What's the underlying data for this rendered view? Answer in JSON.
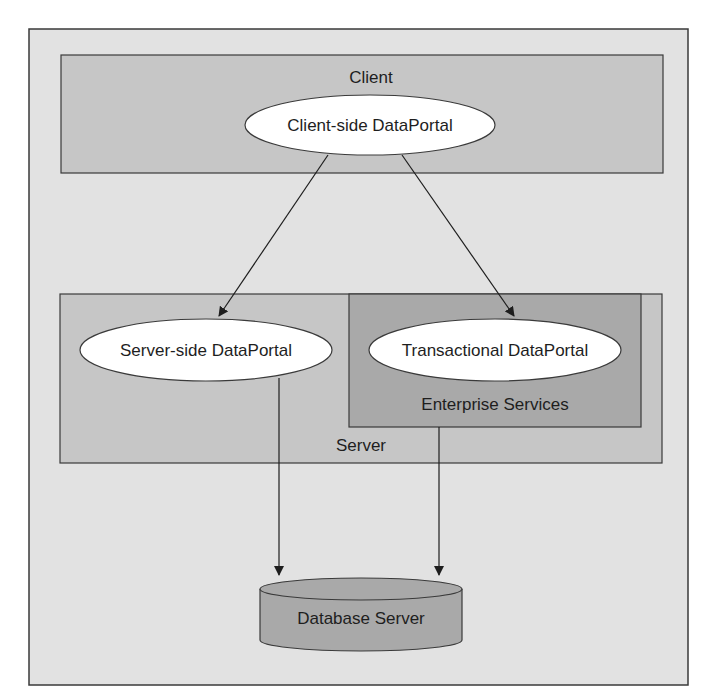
{
  "diagram": {
    "type": "architecture",
    "colors": {
      "page_background": "#ffffff",
      "frame_fill": "#e2e2e2",
      "tier_fill": "#c6c6c6",
      "inner_box_fill": "#a9a9a9",
      "ellipse_fill": "#ffffff",
      "database_fill": "#a9a9a9",
      "stroke": "#3a3a3a"
    },
    "tiers": {
      "client": {
        "label": "Client"
      },
      "server": {
        "label": "Server"
      },
      "enterprise_services": {
        "label": "Enterprise Services"
      }
    },
    "nodes": {
      "client_dataportal": {
        "label": "Client-side DataPortal"
      },
      "server_dataportal": {
        "label": "Server-side DataPortal"
      },
      "transactional_dataportal": {
        "label": "Transactional DataPortal"
      },
      "database_server": {
        "label": "Database Server"
      }
    },
    "edges": [
      {
        "from": "Client-side DataPortal",
        "to": "Server-side DataPortal"
      },
      {
        "from": "Client-side DataPortal",
        "to": "Transactional DataPortal"
      },
      {
        "from": "Server-side DataPortal",
        "to": "Database Server"
      },
      {
        "from": "Transactional DataPortal",
        "to": "Database Server"
      }
    ]
  }
}
